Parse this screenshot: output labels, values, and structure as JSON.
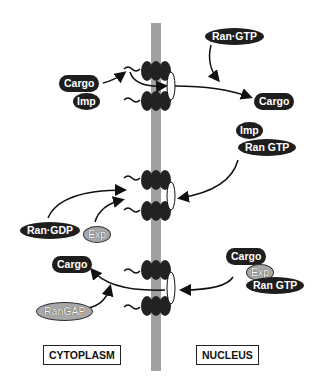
{
  "diagram": {
    "regions": {
      "left": "CYTOPLASM",
      "right": "NUCLEUS"
    },
    "colors": {
      "membrane": "#a0a0a0",
      "molecule_dark": "#1e1e1e",
      "molecule_light": "#a8a8a8",
      "arrow": "#111111"
    },
    "import_panel": {
      "cargo": "Cargo",
      "importin": "Imp",
      "ran_gtp": "Ran·GTP",
      "released_cargo": "Cargo"
    },
    "recycle_panel": {
      "imp": "Imp",
      "ran_gtp": "Ran GTP",
      "ran_gdp": "Ran·GDP",
      "exp": "Exp"
    },
    "export_panel": {
      "cargo_nuclear": "Cargo",
      "exp": "Exp",
      "ran_gtp": "Ran GTP",
      "released_cargo": "Cargo",
      "rangap": "RanGAP"
    }
  }
}
